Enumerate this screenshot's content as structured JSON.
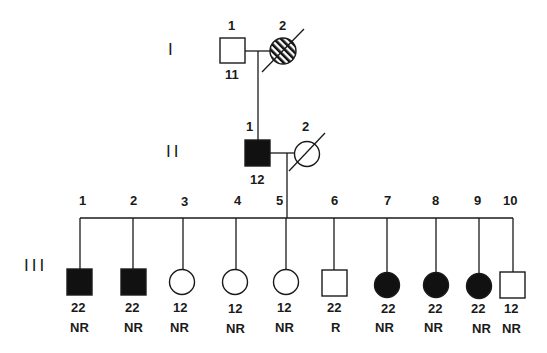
{
  "diagram": {
    "type": "pedigree",
    "colors": {
      "ink": "#1a1a1a",
      "affected_fill": "#111111",
      "background": "#ffffff"
    },
    "generations": [
      {
        "label": "I"
      },
      {
        "label": "II"
      },
      {
        "label": "III"
      }
    ],
    "individuals": {
      "I": [
        {
          "id": "1",
          "sex": "male",
          "status": "unaffected",
          "genotype": "11",
          "deceased": false
        },
        {
          "id": "2",
          "sex": "female",
          "status": "hatched",
          "genotype": "",
          "deceased": true
        }
      ],
      "II": [
        {
          "id": "1",
          "sex": "male",
          "status": "affected",
          "genotype": "12",
          "deceased": false
        },
        {
          "id": "2",
          "sex": "female",
          "status": "unaffected",
          "genotype": "",
          "deceased": true
        }
      ],
      "III": [
        {
          "id": "1",
          "sex": "male",
          "status": "affected",
          "genotype": "22",
          "response": "NR"
        },
        {
          "id": "2",
          "sex": "male",
          "status": "affected",
          "genotype": "22",
          "response": "NR"
        },
        {
          "id": "3",
          "sex": "female",
          "status": "unaffected",
          "genotype": "12",
          "response": "NR"
        },
        {
          "id": "4",
          "sex": "female",
          "status": "unaffected",
          "genotype": "12",
          "response": "NR"
        },
        {
          "id": "5",
          "sex": "female",
          "status": "unaffected",
          "genotype": "12",
          "response": "NR"
        },
        {
          "id": "6",
          "sex": "male",
          "status": "unaffected",
          "genotype": "22",
          "response": "R"
        },
        {
          "id": "7",
          "sex": "female",
          "status": "affected",
          "genotype": "22",
          "response": "NR"
        },
        {
          "id": "8",
          "sex": "female",
          "status": "affected",
          "genotype": "22",
          "response": "NR"
        },
        {
          "id": "9",
          "sex": "female",
          "status": "affected",
          "genotype": "22",
          "response": "NR"
        },
        {
          "id": "10",
          "sex": "male",
          "status": "unaffected",
          "genotype": "12",
          "response": "NR"
        }
      ]
    }
  }
}
